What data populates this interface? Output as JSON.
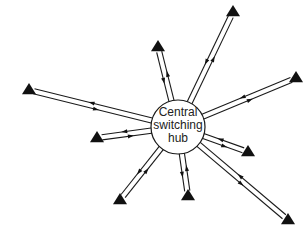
{
  "diagram": {
    "hub": {
      "label_lines": [
        "Central",
        "switching",
        "hub"
      ],
      "cx": 178,
      "cy": 127,
      "r": 27
    },
    "spokes": [
      {
        "name": "spoke-top-left",
        "end": [
          158,
          47
        ]
      },
      {
        "name": "spoke-top-right",
        "end": [
          233,
          12
        ]
      },
      {
        "name": "spoke-right",
        "end": [
          296,
          78
        ]
      },
      {
        "name": "spoke-right-lower",
        "end": [
          248,
          152
        ]
      },
      {
        "name": "spoke-bottom-right",
        "end": [
          288,
          220
        ]
      },
      {
        "name": "spoke-bottom",
        "end": [
          188,
          196
        ]
      },
      {
        "name": "spoke-bottom-left",
        "end": [
          120,
          200
        ]
      },
      {
        "name": "spoke-left-short",
        "end": [
          97,
          138
        ]
      },
      {
        "name": "spoke-left-long",
        "end": [
          29,
          90
        ]
      }
    ],
    "node_shape": "triangle",
    "colors": {
      "line": "#1a1a1a",
      "node": "#111111",
      "background": "#ffffff"
    }
  }
}
